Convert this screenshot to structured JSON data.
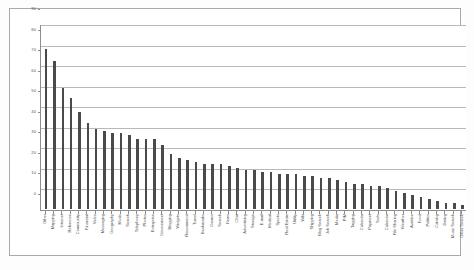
{
  "chart_data": {
    "type": "bar",
    "title": "",
    "subtitle": "",
    "xlabel": "",
    "ylabel": "",
    "ylim": [
      0,
      90
    ],
    "ytick_step": 10,
    "yticks": [
      0,
      10,
      20,
      30,
      40,
      50,
      60,
      70,
      80,
      90
    ],
    "ytick_labels": [
      "0",
      "10",
      "20",
      "30",
      "40",
      "50",
      "60",
      "70",
      "80",
      "90"
    ],
    "grid": true,
    "grid_axis": "y",
    "legend": false,
    "legend_position": "none",
    "bar_color": "#4a4a4a",
    "gridline_color": "#b9b9b9",
    "axis_color": "#8e8e8e",
    "frame_color": "#a9a9a9",
    "background_color": "#ffffff",
    "categories": [
      "Other",
      "Mapping",
      "Internet",
      "Reference",
      "Community",
      "Financial",
      "Video",
      "Messaging",
      "Geography",
      "Music",
      "Search",
      "Telephony",
      "Photos",
      "Enterprise",
      "Government",
      "Blogging",
      "Widgets",
      "Recommend",
      "Travel",
      "Bookmarks",
      "Games",
      "Search",
      "News",
      "Chat",
      "Advertising",
      "Storage",
      "E-mail",
      "Medical",
      "Sports",
      "Real Estate",
      "Utility",
      "Wiki",
      "Shipping",
      "Blog Search",
      "Job Search",
      "Media",
      "PIM",
      "Tagging",
      "Calendar",
      "Payment",
      "Tools",
      "Calendar",
      "File Sharing",
      "Weather",
      "Aviation",
      "Food",
      "Politics",
      "Catalog",
      "Dating",
      "Music Search",
      "Other Search"
    ],
    "values": [
      78,
      72,
      59,
      54,
      47,
      42,
      39,
      38,
      37,
      37,
      36,
      34,
      34,
      34,
      31,
      27,
      25,
      24,
      23,
      22,
      22,
      22,
      21,
      20,
      19,
      19,
      18,
      18,
      17,
      17,
      17,
      16,
      16,
      15,
      15,
      14,
      13,
      12,
      12,
      11,
      11,
      10,
      9,
      8,
      7,
      6,
      5,
      4,
      3,
      3,
      2
    ]
  }
}
